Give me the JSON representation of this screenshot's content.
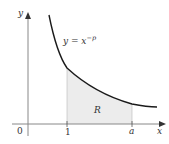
{
  "diagram": {
    "type": "area-under-curve",
    "curve_label": "y = x",
    "curve_exponent": "−p",
    "region_label": "R",
    "x_axis_label": "x",
    "y_axis_label": "y",
    "origin_label": "0",
    "tick_labels": [
      "1",
      "a"
    ],
    "colors": {
      "axis": "#888888",
      "curve": "#1a1a1a",
      "region_fill": "#ececec",
      "text": "#333333"
    }
  }
}
